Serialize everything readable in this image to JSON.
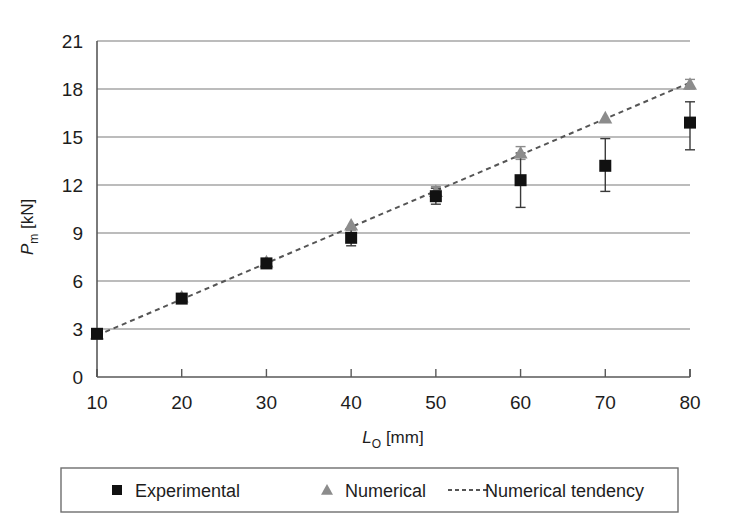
{
  "figure": {
    "clipped_header_text": "",
    "background_color": "#ffffff",
    "frame_color": "#595959",
    "gridline_color": "#7a7a7a"
  },
  "axes": {
    "y_axis_label_main": "P",
    "y_axis_label_sub": "m",
    "y_axis_label_unit": " [kN]",
    "x_axis_label_main": "L",
    "x_axis_label_sub": "O",
    "x_axis_label_unit": " [mm]",
    "y_ticks": [
      "0",
      "3",
      "6",
      "9",
      "12",
      "15",
      "18",
      "21"
    ],
    "x_ticks": [
      "10",
      "20",
      "30",
      "40",
      "50",
      "60",
      "70",
      "80"
    ]
  },
  "legend": {
    "items": [
      {
        "label": "Experimental",
        "marker": "square-marker",
        "color": "#111111"
      },
      {
        "label": "Numerical",
        "marker": "triangle-marker",
        "color": "#8c8c8c"
      },
      {
        "label": "Numerical tendency",
        "marker": "dotted-line-marker",
        "color": "#555555"
      }
    ]
  },
  "chart_data": {
    "type": "scatter",
    "title": "",
    "xlabel": "L_O [mm]",
    "ylabel": "P_m [kN]",
    "xlim": [
      10,
      80
    ],
    "ylim": [
      0,
      21
    ],
    "ytick_step": 3,
    "xtick_step": 10,
    "grid": "horizontal",
    "legend_position": "bottom",
    "x": [
      10,
      20,
      30,
      40,
      50,
      60,
      70,
      80
    ],
    "series": [
      {
        "name": "Experimental",
        "marker": "square",
        "color": "#111111",
        "values": [
          2.7,
          4.9,
          7.1,
          8.7,
          11.3,
          12.3,
          13.2,
          15.9
        ],
        "error_low": [
          2.5,
          4.7,
          6.9,
          8.2,
          10.8,
          10.6,
          11.6,
          14.2
        ],
        "error_high": [
          2.9,
          5.1,
          7.3,
          9.2,
          11.8,
          14.0,
          14.9,
          17.2
        ]
      },
      {
        "name": "Numerical",
        "marker": "triangle",
        "color": "#8c8c8c",
        "values": [
          2.7,
          5.0,
          7.2,
          9.5,
          11.6,
          14.0,
          16.2,
          18.3
        ],
        "error_low": [
          2.7,
          5.0,
          7.2,
          9.5,
          11.4,
          13.6,
          16.2,
          18.0
        ],
        "error_high": [
          2.7,
          5.0,
          7.2,
          9.5,
          11.9,
          14.4,
          16.2,
          18.6
        ]
      }
    ],
    "trendline": {
      "name": "Numerical tendency",
      "style": "dotted",
      "color": "#555555",
      "x_start": 10,
      "y_start": 2.6,
      "x_end": 80,
      "y_end": 18.4
    }
  }
}
